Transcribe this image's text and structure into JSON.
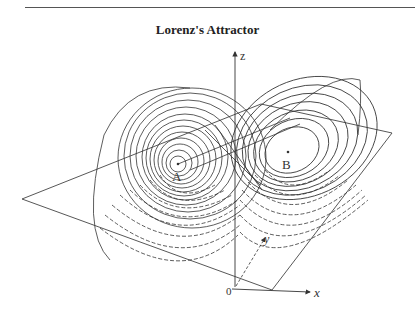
{
  "title": "Lorenz's Attractor",
  "labels": {
    "z_axis": "z",
    "x_axis": "x",
    "y_axis": "y",
    "origin": "0",
    "fixed_point_a": "A",
    "fixed_point_b": "B"
  },
  "colors": {
    "ink": "#333333",
    "background": "#ffffff"
  }
}
